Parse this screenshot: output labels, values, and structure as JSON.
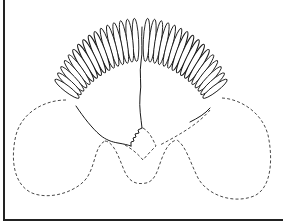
{
  "figure": {
    "type": "scientific line drawing",
    "lamellae_count_left": 16,
    "lamellae_count_right": 16,
    "colors": {
      "line": "#1a1a1a",
      "dashed_outline": "#333333",
      "background": "#ffffff",
      "frame": "#222222"
    },
    "frame": {
      "left_border": true,
      "bottom_border": true,
      "top_border": false,
      "right_border": false
    }
  }
}
